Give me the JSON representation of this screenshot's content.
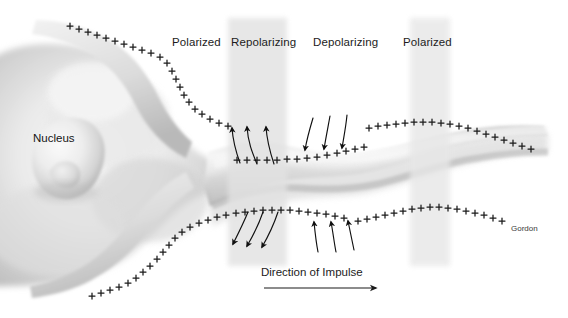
{
  "figure": {
    "width": 568,
    "height": 318,
    "background_color": "#ffffff"
  },
  "labels": {
    "nucleus": "Nucleus",
    "signature": "Gordon",
    "impulse_caption": "Direction of Impulse"
  },
  "regions": [
    {
      "id": "region-polarized-left",
      "label": "Polarized",
      "label_x": 172,
      "label_y": 36,
      "band": false
    },
    {
      "id": "region-repolarizing",
      "label": "Repolarizing",
      "label_x": 231,
      "label_y": 36,
      "band": true,
      "band_x": 228,
      "band_width": 59,
      "band_color": "#e2e2e2"
    },
    {
      "id": "region-depolarizing",
      "label": "Depolarizing",
      "label_x": 313,
      "label_y": 36,
      "band": false
    },
    {
      "id": "region-polarized-right",
      "label": "Polarized",
      "label_x": 403,
      "label_y": 36,
      "band": true,
      "band_x": 410,
      "band_width": 40,
      "band_color": "#e6e6e6"
    }
  ],
  "impulse_arrow": {
    "x1": 264,
    "y1": 288,
    "x2": 378,
    "y2": 288,
    "color": "#1a1a1a"
  },
  "charge_marks": {
    "glyph": "+",
    "color": "#1b1b1b",
    "description": "Positive charge markers distributed along neuron membranes"
  },
  "ion_arrows": {
    "color": "#101010",
    "groups": [
      {
        "id": "repolarizing-top-outflow",
        "direction": "up",
        "count": 3,
        "region": "Repolarizing"
      },
      {
        "id": "depolarizing-top-inflow",
        "direction": "down",
        "count": 3,
        "region": "Depolarizing"
      },
      {
        "id": "repolarizing-bottom-outflow",
        "direction": "down",
        "count": 3,
        "region": "Repolarizing"
      },
      {
        "id": "depolarizing-bottom-inflow",
        "direction": "up",
        "count": 3,
        "region": "Depolarizing"
      }
    ]
  },
  "palette": {
    "cell_light": "#f4f4f4",
    "cell_mid": "#d8d8d8",
    "cell_shadow": "#b4b4b4",
    "cell_deep": "#9a9a9a",
    "nucleus_light": "#f2f2f2",
    "nucleus_shadow": "#bdbdbd",
    "ink": "#1a1a1a",
    "band": "#e2e2e2"
  }
}
